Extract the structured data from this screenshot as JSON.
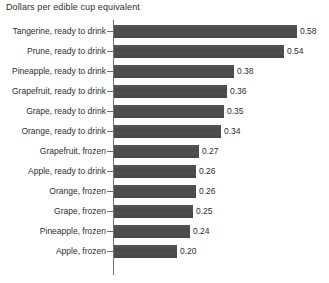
{
  "chart_data": {
    "type": "bar",
    "orientation": "horizontal",
    "title": "Dollars per edible cup equivalent",
    "xlabel": "",
    "ylabel": "",
    "xlim": [
      0,
      0.62
    ],
    "grid": false,
    "legend": false,
    "bar_color": "#4d4d4d",
    "axis_color": "#6f6f6f",
    "text_color": "#2e2e2e",
    "categories": [
      "Tangerine, ready to drink",
      "Prune, ready to drink",
      "Pineapple, ready to drink",
      "Grapefruit, ready to drink",
      "Grape, ready to drink",
      "Orange, ready to drink",
      "Grapefruit, frozen",
      "Apple, ready to drink",
      "Orange, frozen",
      "Grape, frozen",
      "Pineapple, frozen",
      "Apple, frozen"
    ],
    "values": [
      0.58,
      0.54,
      0.38,
      0.36,
      0.35,
      0.34,
      0.27,
      0.26,
      0.26,
      0.25,
      0.24,
      0.2
    ],
    "value_labels": [
      "0.58",
      "0.54",
      "0.38",
      "0.36",
      "0.35",
      "0.34",
      "0.27",
      "0.26",
      "0.26",
      "0.25",
      "0.24",
      "0.20"
    ]
  },
  "rows": [
    {
      "label": "Tangerine, ready to drink",
      "value": "0.58"
    },
    {
      "label": "Prune, ready to drink",
      "value": "0.54"
    },
    {
      "label": "Pineapple, ready to drink",
      "value": "0.38"
    },
    {
      "label": "Grapefruit, ready to drink",
      "value": "0.36"
    },
    {
      "label": "Grape, ready to drink",
      "value": "0.35"
    },
    {
      "label": "Orange, ready to drink",
      "value": "0.34"
    },
    {
      "label": "Grapefruit, frozen",
      "value": "0.27"
    },
    {
      "label": "Apple, ready to drink",
      "value": "0.26"
    },
    {
      "label": "Orange, frozen",
      "value": "0.26"
    },
    {
      "label": "Grape, frozen",
      "value": "0.25"
    },
    {
      "label": "Pineapple, frozen",
      "value": "0.24"
    },
    {
      "label": "Apple, frozen",
      "value": "0.20"
    }
  ]
}
